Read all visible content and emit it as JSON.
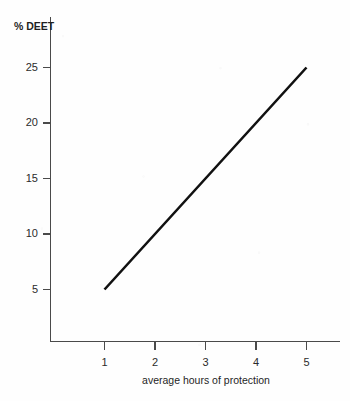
{
  "chart_data": {
    "type": "line",
    "title": "",
    "xlabel": "average hours of protection",
    "ylabel": "% DEET",
    "x": [
      1,
      5
    ],
    "values": [
      5,
      25
    ],
    "series": [
      {
        "name": "% DEET vs average hours of protection",
        "x": [
          1,
          2,
          3,
          4,
          5
        ],
        "values": [
          5,
          10,
          15,
          20,
          25
        ]
      }
    ],
    "xlim": [
      0.45,
      5.65
    ],
    "ylim": [
      0.2,
      27.5
    ],
    "xticks": [
      1,
      2,
      3,
      4,
      5
    ],
    "yticks": [
      5,
      10,
      15,
      20,
      25
    ],
    "xtick_labels": [
      "1",
      "2",
      "3",
      "4",
      "5"
    ],
    "ytick_labels": [
      "5",
      "10",
      "15",
      "20",
      "25"
    ],
    "grid": false,
    "legend": false,
    "legend_position": "none",
    "line_color": "#111111",
    "axis_color": "#4a4a4a",
    "background_color": "#fefefe"
  },
  "axes": {
    "y_title": "% DEET",
    "x_title": "average hours of protection"
  }
}
